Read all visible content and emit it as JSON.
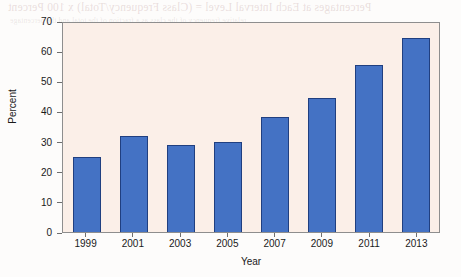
{
  "chart_data": {
    "type": "bar",
    "title": "",
    "subtitle": "",
    "xlabel": "Year",
    "ylabel": "Percent",
    "categories": [
      "1999",
      "2001",
      "2003",
      "2005",
      "2007",
      "2009",
      "2011",
      "2013"
    ],
    "values": [
      25,
      32,
      29,
      30,
      38,
      44.5,
      55.5,
      64.5
    ],
    "series": [
      {
        "name": "Percent",
        "values": [
          25,
          32,
          29,
          30,
          38,
          44.5,
          55.5,
          64.5
        ]
      }
    ],
    "ylim": [
      0,
      70
    ],
    "ytick_labels": [
      "0",
      "10",
      "20",
      "30",
      "40",
      "50",
      "60",
      "70"
    ],
    "ytick_values": [
      0,
      10,
      20,
      30,
      40,
      50,
      60,
      70
    ],
    "xtick_labels": [
      "1999",
      "2001",
      "2003",
      "2005",
      "2007",
      "2009",
      "2011",
      "2013"
    ],
    "grid": false,
    "legend": "none",
    "annotations": [],
    "colors": {
      "bar_fill": "#4472c4",
      "bar_edge": "#203f80",
      "plot_background": "#fbefe8",
      "page_background": "#fdfcfb",
      "axis_line": "#8e8e8e",
      "tick_label": "#1a1a1a"
    }
  },
  "bleed_text": {
    "title": "Percentages at Each Interval Level = (Class Frequency/Total) x 100 Percent",
    "line2": "relative frequency of the class as a fraction of the total and the percentage",
    "line3": "Housing",
    "line4": "Construction",
    "line5": "Other Facilities",
    "line6": "Capital Goods",
    "line7": "Services",
    "line8": "Materials"
  }
}
